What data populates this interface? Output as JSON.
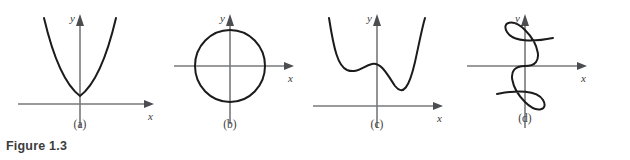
{
  "figure": {
    "caption": "Figure 1.3",
    "background_color": "#ffffff",
    "curve_color": "#1b1b1b",
    "axis_color": "#77787b",
    "label_color": "#3a3a3c"
  },
  "panels": [
    {
      "tag": "(a)",
      "name": "parabola",
      "description": "upward parabola with vertex just above origin",
      "x_axis_label": "x",
      "y_axis_label": "y",
      "axes": "x-axis horizontal full width, y-axis vertical with arrow up"
    },
    {
      "tag": "(b)",
      "name": "circle",
      "description": "circle centered at the origin",
      "x_axis_label": "x",
      "y_axis_label": "y",
      "axes": "x-axis horizontal through center, y-axis vertical through center"
    },
    {
      "tag": "(c)",
      "name": "quartic",
      "description": "quartic curve with left local minimum, local maximum near y-axis, and deeper right minimum",
      "x_axis_label": "x",
      "y_axis_label": "y",
      "axes": "x-axis horizontal below curve, y-axis vertical with arrow up"
    },
    {
      "tag": "(d)",
      "name": "s-curve",
      "description": "sideways S-shaped cubic passing through the origin",
      "x_axis_label": "x",
      "y_axis_label": "y",
      "axes": "x-axis horizontal through origin, y-axis vertical through origin"
    }
  ]
}
